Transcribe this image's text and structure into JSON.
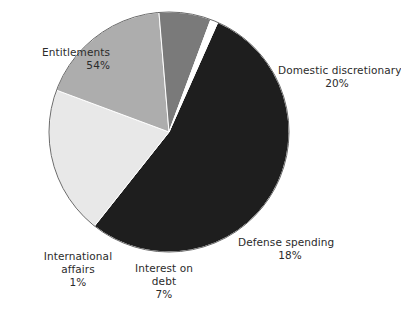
{
  "chart_data": {
    "type": "pie",
    "title": "",
    "subtitle": "",
    "xlabel": "",
    "ylabel": "",
    "legend_position": "none",
    "grid": false,
    "labels_inline": true,
    "units": "percent",
    "total": 100,
    "categories": [
      "Entitlements",
      "Domestic discretionary",
      "Defense spending",
      "Interest on debt",
      "International affairs"
    ],
    "values": [
      54,
      20,
      18,
      7,
      1
    ],
    "slices": [
      {
        "name": "Entitlements",
        "value": 54,
        "value_text": "54%",
        "color": "#1e1e1e",
        "start_angle": 24,
        "end_angle": 218.4,
        "label_align": "right"
      },
      {
        "name": "Domestic discretionary",
        "value": 20,
        "value_text": "20%",
        "color": "#e8e8e8",
        "start_angle": 24,
        "end_angle": -48,
        "label_align": "left"
      },
      {
        "name": "Defense spending",
        "value": 18,
        "value_text": "18%",
        "color": "#adadad",
        "start_angle": -48,
        "end_angle": -112.8,
        "label_align": "left"
      },
      {
        "name": "Interest on debt",
        "value": 7,
        "value_text": "7%",
        "color": "#7a7a7a",
        "start_angle": -112.8,
        "end_angle": -138,
        "label_align": "center"
      },
      {
        "name": "International affairs",
        "value": 1,
        "value_text": "1%",
        "color": "#ffffff",
        "start_angle": -138,
        "end_angle": -141.6,
        "label_align": "center"
      }
    ],
    "geometry": {
      "center_x": 169,
      "center_y": 132,
      "radius": 120,
      "outline_color": "#555555"
    }
  },
  "labels": {
    "entitlements": {
      "name": "Entitlements",
      "value": "54%"
    },
    "domestic": {
      "name": "Domestic discretionary",
      "value": "20%"
    },
    "defense": {
      "name": "Defense spending",
      "value": "18%"
    },
    "international": {
      "name_line1": "International",
      "name_line2": "affairs",
      "value": "1%"
    },
    "interest": {
      "name_line1": "Interest on",
      "name_line2": "debt",
      "value": "7%"
    }
  }
}
